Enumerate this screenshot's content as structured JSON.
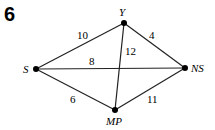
{
  "question_number": "6",
  "nodes": [
    {
      "id": "S",
      "label": "S",
      "x": 36,
      "y": 69
    },
    {
      "id": "Y",
      "label": "Y",
      "x": 124,
      "y": 23
    },
    {
      "id": "NS",
      "label": "NS",
      "x": 185,
      "y": 68
    },
    {
      "id": "MP",
      "label": "MP",
      "x": 115,
      "y": 110
    }
  ],
  "edges": [
    {
      "from": "S",
      "to": "Y",
      "weight": "10"
    },
    {
      "from": "Y",
      "to": "NS",
      "weight": "4"
    },
    {
      "from": "S",
      "to": "NS",
      "weight": "8"
    },
    {
      "from": "Y",
      "to": "MP",
      "weight": "12"
    },
    {
      "from": "S",
      "to": "MP",
      "weight": "6"
    },
    {
      "from": "MP",
      "to": "NS",
      "weight": "11"
    }
  ]
}
